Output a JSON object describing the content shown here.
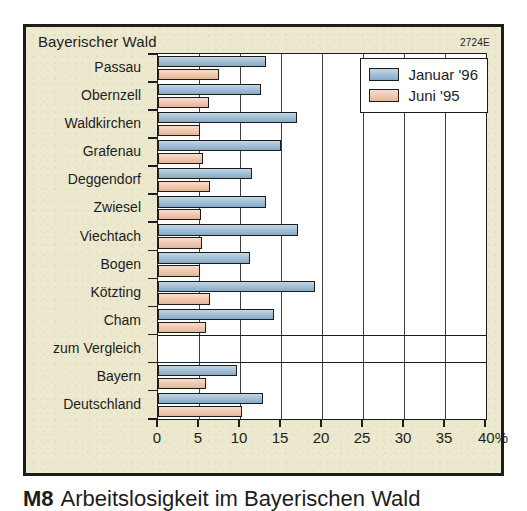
{
  "header": {
    "title": "Bayerischer Wald",
    "code": "2724E"
  },
  "legend": {
    "items": [
      {
        "label": "Januar '96",
        "color": "#8fb4d0",
        "key": "jan"
      },
      {
        "label": "Juni '95",
        "color": "#f3c0a2",
        "key": "jun"
      }
    ]
  },
  "caption": {
    "number": "M8",
    "text": "Arbeitslosigkeit im Bayerischen Wald"
  },
  "axis": {
    "x_ticks": [
      "0",
      "5",
      "10",
      "15",
      "20",
      "25",
      "30",
      "35",
      "40%"
    ],
    "unit": "%"
  },
  "chart_data": {
    "type": "bar",
    "orientation": "horizontal",
    "title": "Bayerischer Wald",
    "xlabel": "40%",
    "ylabel": "",
    "xlim": [
      0,
      40
    ],
    "grid": true,
    "legend_position": "top-right",
    "categories": [
      "Passau",
      "Obernzell",
      "Waldkirchen",
      "Grafenau",
      "Deggendorf",
      "Zwiesel",
      "Viechtach",
      "Bogen",
      "Kötzting",
      "Cham",
      "zum Vergleich",
      "Bayern",
      "Deutschland"
    ],
    "separator_category": "zum Vergleich",
    "series": [
      {
        "name": "Januar '96",
        "color": "#8fb4d0",
        "values": [
          13.2,
          12.6,
          16.9,
          15.0,
          11.5,
          13.2,
          17.1,
          11.2,
          19.1,
          14.1,
          null,
          9.6,
          12.8
        ]
      },
      {
        "name": "Juni '95",
        "color": "#f3c0a2",
        "values": [
          7.4,
          6.2,
          5.1,
          5.5,
          6.3,
          5.2,
          5.4,
          5.1,
          6.4,
          5.8,
          null,
          5.8,
          10.2
        ]
      }
    ]
  }
}
